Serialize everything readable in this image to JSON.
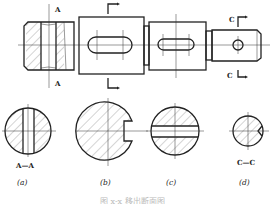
{
  "figure": {
    "title": "图 x-x 移出断面图",
    "main_view": {
      "section_marks": {
        "a_top": "A",
        "a_bottom": "A",
        "c_top": "C",
        "c_bottom": "C"
      }
    },
    "sections": [
      {
        "id": "a",
        "name_label": "A—A",
        "caption": "(a)"
      },
      {
        "id": "b",
        "name_label": "",
        "caption": "(b)"
      },
      {
        "id": "c",
        "name_label": "",
        "caption": "(c)"
      },
      {
        "id": "d",
        "name_label": "C—C",
        "caption": "(d)"
      }
    ]
  }
}
